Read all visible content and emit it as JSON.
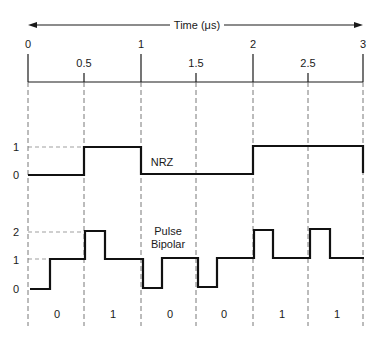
{
  "time_axis": {
    "title": "Time (μs)",
    "major_ticks": [
      {
        "label": "0",
        "value": 0
      },
      {
        "label": "1",
        "value": 1
      },
      {
        "label": "2",
        "value": 2
      },
      {
        "label": "3",
        "value": 3
      }
    ],
    "minor_ticks": [
      {
        "label": "0.5",
        "value": 0.5
      },
      {
        "label": "1.5",
        "value": 1.5
      },
      {
        "label": "2.5",
        "value": 2.5
      }
    ]
  },
  "nrz": {
    "label": "NRZ",
    "levels": [
      {
        "label": "1",
        "value": 1
      },
      {
        "label": "0",
        "value": 0
      }
    ],
    "bits": [
      0,
      1,
      0,
      0,
      1,
      1
    ]
  },
  "pulse_bipolar": {
    "label_line1": "Pulse",
    "label_line2": "Bipolar",
    "levels": [
      {
        "label": "2",
        "value": 2
      },
      {
        "label": "1",
        "value": 1
      },
      {
        "label": "0",
        "value": 0
      }
    ],
    "bits": [
      0,
      1,
      0,
      0,
      1,
      1
    ]
  },
  "bit_labels": [
    "0",
    "1",
    "0",
    "0",
    "1",
    "1"
  ],
  "colors": {
    "line": "#111111",
    "background": "#ffffff"
  }
}
